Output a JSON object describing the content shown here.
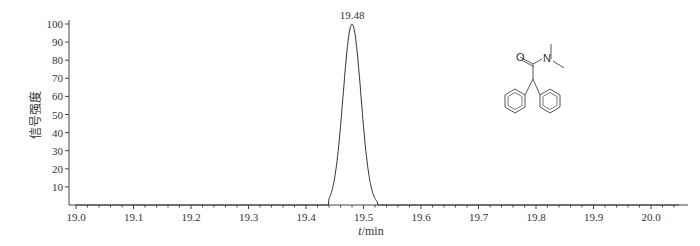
{
  "chart_data": {
    "type": "line",
    "title": "",
    "xlabel": "t/min",
    "xlabel_italic": "t",
    "xlabel_unit": "/min",
    "ylabel": "信号强度",
    "xlim": [
      19.0,
      20.0
    ],
    "ylim": [
      0,
      100
    ],
    "x_ticks": [
      "19.0",
      "19.1",
      "19.2",
      "19.3",
      "19.4",
      "19.5",
      "19.6",
      "19.7",
      "19.8",
      "19.9",
      "20.0"
    ],
    "y_ticks": [
      "10",
      "20",
      "30",
      "40",
      "50",
      "60",
      "70",
      "80",
      "90",
      "100"
    ],
    "grid": false,
    "legend": null,
    "series": [
      {
        "name": "chromatogram",
        "x": [
          19.0,
          19.44,
          19.45,
          19.46,
          19.47,
          19.48,
          19.49,
          19.5,
          19.51,
          19.52,
          19.53,
          20.05
        ],
        "y": [
          0,
          0,
          10,
          45,
          85,
          100,
          85,
          45,
          12,
          2,
          0,
          0
        ]
      }
    ],
    "annotations": [
      {
        "text": "19.48",
        "x": 19.48,
        "y": 100
      }
    ],
    "inset": "Chemical structure of N,N-dimethyl-2,2-diphenylacetamide (O, N labeled)",
    "color": "#333333"
  },
  "labels": {
    "peak": "19.48",
    "atom_o": "O",
    "atom_n": "N",
    "x_italic": "t",
    "x_unit": "/min",
    "y_axis": "信号强度"
  }
}
